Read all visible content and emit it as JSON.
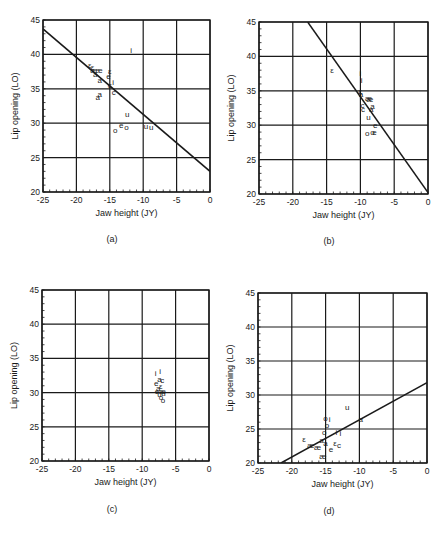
{
  "figure": {
    "panels_layout": [
      {
        "id": "a",
        "caption": "(a)",
        "frame": {
          "x0": 43,
          "x1": 210,
          "y0": 20,
          "y1": 192
        },
        "caption_pos": {
          "x": 112,
          "y": 242
        }
      },
      {
        "id": "b",
        "caption": "(b)",
        "frame": {
          "x0": 259,
          "x1": 428,
          "y0": 22,
          "y1": 194
        },
        "caption_pos": {
          "x": 329,
          "y": 244
        }
      },
      {
        "id": "c",
        "caption": "(c)",
        "frame": {
          "x0": 42,
          "x1": 209,
          "y0": 290,
          "y1": 461
        },
        "caption_pos": {
          "x": 112,
          "y": 512
        }
      },
      {
        "id": "d",
        "caption": "(d)",
        "frame": {
          "x0": 258,
          "x1": 427,
          "y0": 293,
          "y1": 463
        },
        "caption_pos": {
          "x": 329,
          "y": 514
        }
      }
    ],
    "colors": {
      "ink": "#1a1a1a",
      "grid": "#1a1a1a",
      "background": "#ffffff"
    }
  },
  "chart_data": [
    {
      "panel": "(a)",
      "type": "scatter",
      "title": "",
      "xlabel": "Jaw height (JY)",
      "ylabel": "Lip opening (LO)",
      "xlim": [
        -25,
        0
      ],
      "ylim": [
        20,
        45
      ],
      "xticks": [
        -25,
        -20,
        -15,
        -10,
        -5,
        0
      ],
      "yticks": [
        20,
        25,
        30,
        35,
        40,
        45
      ],
      "grid": true,
      "regression_line": {
        "x": [
          -25,
          0
        ],
        "y": [
          43.7,
          23.0
        ]
      },
      "points": [
        {
          "x": -11.8,
          "y": 40.6,
          "label": "i"
        },
        {
          "x": -18.0,
          "y": 38.4,
          "label": "ε"
        },
        {
          "x": -17.6,
          "y": 38.2,
          "label": "ε"
        },
        {
          "x": -17.4,
          "y": 37.8,
          "label": "æ"
        },
        {
          "x": -16.6,
          "y": 37.8,
          "label": "æ"
        },
        {
          "x": -17.2,
          "y": 37.1,
          "label": "a"
        },
        {
          "x": -16.5,
          "y": 36.3,
          "label": "a"
        },
        {
          "x": -15.0,
          "y": 37.6,
          "label": "ε"
        },
        {
          "x": -15.2,
          "y": 36.8,
          "label": "e"
        },
        {
          "x": -14.5,
          "y": 36.0,
          "label": "i"
        },
        {
          "x": -15.0,
          "y": 35.5,
          "label": "c"
        },
        {
          "x": -16.8,
          "y": 33.8,
          "label": "a"
        },
        {
          "x": -16.5,
          "y": 34.3,
          "label": "a"
        },
        {
          "x": -14.4,
          "y": 34.6,
          "label": "c"
        },
        {
          "x": -12.4,
          "y": 31.4,
          "label": "u"
        },
        {
          "x": -13.3,
          "y": 29.8,
          "label": "e"
        },
        {
          "x": -12.5,
          "y": 29.5,
          "label": "o"
        },
        {
          "x": -14.2,
          "y": 29.0,
          "label": "o"
        },
        {
          "x": -9.6,
          "y": 29.6,
          "label": "u"
        },
        {
          "x": -8.8,
          "y": 29.4,
          "label": "u"
        }
      ]
    },
    {
      "panel": "(b)",
      "type": "scatter",
      "title": "",
      "xlabel": "Jaw height (JY)",
      "ylabel": "Lip opening (LO)",
      "xlim": [
        -25,
        0
      ],
      "ylim": [
        20,
        45
      ],
      "xticks": [
        -25,
        -20,
        -15,
        -10,
        -5,
        0
      ],
      "yticks": [
        20,
        25,
        30,
        35,
        40,
        45
      ],
      "grid": true,
      "regression_line": {
        "x": [
          -17.8,
          0
        ],
        "y": [
          45,
          20.2
        ]
      },
      "points": [
        {
          "x": -14.2,
          "y": 38.0,
          "label": "ε"
        },
        {
          "x": -10.0,
          "y": 37.6,
          "label": "i"
        },
        {
          "x": -9.8,
          "y": 36.6,
          "label": "i"
        },
        {
          "x": -10.0,
          "y": 35.0,
          "label": "ε"
        },
        {
          "x": -9.9,
          "y": 34.6,
          "label": "a"
        },
        {
          "x": -8.8,
          "y": 34.0,
          "label": "æ"
        },
        {
          "x": -8.6,
          "y": 33.8,
          "label": "æ"
        },
        {
          "x": -9.7,
          "y": 33.0,
          "label": "c"
        },
        {
          "x": -9.6,
          "y": 32.4,
          "label": "c"
        },
        {
          "x": -8.2,
          "y": 32.8,
          "label": "a"
        },
        {
          "x": -8.4,
          "y": 32.4,
          "label": "a"
        },
        {
          "x": -8.8,
          "y": 31.2,
          "label": "u"
        },
        {
          "x": -7.8,
          "y": 30.0,
          "label": "e"
        },
        {
          "x": -8.2,
          "y": 29.0,
          "label": "o"
        },
        {
          "x": -7.9,
          "y": 29.0,
          "label": "e"
        },
        {
          "x": -9.0,
          "y": 28.8,
          "label": "o"
        }
      ]
    },
    {
      "panel": "(c)",
      "type": "scatter",
      "title": "",
      "xlabel": "Jaw height (JY)",
      "ylabel": "Lip opening (LO)",
      "xlim": [
        -25,
        0
      ],
      "ylim": [
        20,
        45
      ],
      "xticks": [
        -25,
        -20,
        -15,
        -10,
        -5,
        0
      ],
      "yticks": [
        20,
        25,
        30,
        35,
        40,
        45
      ],
      "grid": true,
      "regression_line": null,
      "points": [
        {
          "x": -8.0,
          "y": 32.8,
          "label": "i"
        },
        {
          "x": -7.3,
          "y": 33.2,
          "label": "i"
        },
        {
          "x": -7.4,
          "y": 32.0,
          "label": "a"
        },
        {
          "x": -7.0,
          "y": 31.8,
          "label": "c"
        },
        {
          "x": -7.9,
          "y": 31.4,
          "label": "e"
        },
        {
          "x": -7.2,
          "y": 31.0,
          "label": "ε"
        },
        {
          "x": -7.6,
          "y": 30.6,
          "label": "a"
        },
        {
          "x": -7.8,
          "y": 30.2,
          "label": "e"
        },
        {
          "x": -7.0,
          "y": 30.2,
          "label": "æ"
        },
        {
          "x": -6.8,
          "y": 30.0,
          "label": "u"
        },
        {
          "x": -7.4,
          "y": 29.8,
          "label": "u"
        },
        {
          "x": -7.2,
          "y": 29.4,
          "label": "o"
        },
        {
          "x": -6.9,
          "y": 28.9,
          "label": "o"
        }
      ]
    },
    {
      "panel": "(d)",
      "type": "scatter",
      "title": "",
      "xlabel": "Jaw height (JY)",
      "ylabel": "Lip opening (LO)",
      "xlim": [
        -25,
        0
      ],
      "ylim": [
        20,
        45
      ],
      "xticks": [
        -25,
        -20,
        -15,
        -10,
        -5,
        0
      ],
      "yticks": [
        20,
        25,
        30,
        35,
        40,
        45
      ],
      "grid": true,
      "regression_line": {
        "x": [
          -21.6,
          0
        ],
        "y": [
          20,
          31.8
        ]
      },
      "points": [
        {
          "x": -11.8,
          "y": 28.2,
          "label": "u"
        },
        {
          "x": -15.0,
          "y": 26.6,
          "label": "o"
        },
        {
          "x": -14.4,
          "y": 26.4,
          "label": "i"
        },
        {
          "x": -14.8,
          "y": 25.6,
          "label": "o"
        },
        {
          "x": -9.8,
          "y": 26.4,
          "label": "a"
        },
        {
          "x": -15.2,
          "y": 24.6,
          "label": "o"
        },
        {
          "x": -13.4,
          "y": 24.6,
          "label": "i"
        },
        {
          "x": -12.8,
          "y": 24.4,
          "label": "i"
        },
        {
          "x": -18.2,
          "y": 23.6,
          "label": "ε"
        },
        {
          "x": -17.2,
          "y": 22.6,
          "label": "æ"
        },
        {
          "x": -16.2,
          "y": 22.4,
          "label": "æ"
        },
        {
          "x": -15.6,
          "y": 23.4,
          "label": "a"
        },
        {
          "x": -15.0,
          "y": 23.0,
          "label": "a"
        },
        {
          "x": -13.6,
          "y": 23.0,
          "label": "ε"
        },
        {
          "x": -13.0,
          "y": 22.6,
          "label": "c"
        },
        {
          "x": -14.2,
          "y": 22.0,
          "label": "e"
        },
        {
          "x": -15.4,
          "y": 21.0,
          "label": "æ"
        }
      ]
    }
  ]
}
